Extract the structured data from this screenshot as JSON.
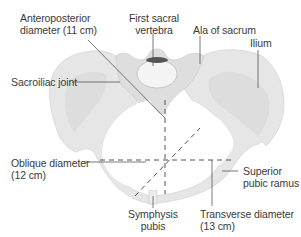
{
  "figure": {
    "colors": {
      "bone_light": "#e8e8e8",
      "bone_mid": "#d9d9d9",
      "bone_shade": "#cfcfcf",
      "vertebra_body": "#f4f4f4",
      "vertebra_canal": "#555555",
      "line": "#555555",
      "text": "#3a3a3a"
    }
  },
  "labels": {
    "anteroposterior": {
      "line1": "Anteroposterior",
      "line2": "diameter (11 cm)"
    },
    "first_sacral": {
      "line1": "First sacral",
      "line2": "vertebra"
    },
    "ala_sacrum": {
      "line1": "Ala of sacrum"
    },
    "ilium": {
      "line1": "Ilium"
    },
    "sacroiliac": {
      "line1": "Sacroiliac joint"
    },
    "oblique": {
      "line1": "Oblique diameter",
      "line2": "(12 cm)"
    },
    "superior_pubic": {
      "line1": "Superior",
      "line2": "pubic ramus"
    },
    "symphysis": {
      "line1": "Symphysis",
      "line2": "pubis"
    },
    "transverse": {
      "line1": "Transverse diameter",
      "line2": "(13 cm)"
    }
  },
  "measurements": {
    "anteroposterior_cm": 11,
    "oblique_cm": 12,
    "transverse_cm": 13
  }
}
